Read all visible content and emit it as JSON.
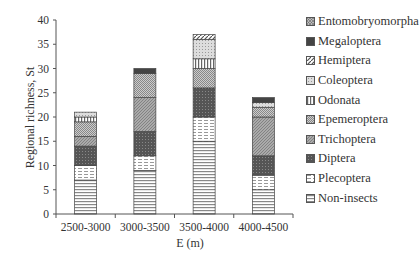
{
  "chart_data": {
    "type": "bar",
    "stacked": true,
    "title": "",
    "xlabel": "E (m)",
    "ylabel": "Regional richness, St",
    "ylim": [
      0,
      40
    ],
    "yticks": [
      0,
      5,
      10,
      15,
      20,
      25,
      30,
      35,
      40
    ],
    "grid": false,
    "legend_position": "right",
    "categories": [
      "2500-3000",
      "3000-3500",
      "3500-4000",
      "4000-4500"
    ],
    "series": [
      {
        "name": "Non-insects",
        "values": [
          7,
          9,
          15,
          5
        ],
        "pattern": "hstripes"
      },
      {
        "name": "Plecoptera",
        "values": [
          3,
          3,
          5,
          3
        ],
        "pattern": "dashes"
      },
      {
        "name": "Diptera",
        "values": [
          4,
          5,
          6,
          4
        ],
        "pattern": "dark-dots"
      },
      {
        "name": "Trichoptera",
        "values": [
          2,
          7,
          0,
          8
        ],
        "pattern": "diag-dense"
      },
      {
        "name": "Epemeroptera",
        "values": [
          3,
          5,
          4,
          2
        ],
        "pattern": "checker"
      },
      {
        "name": "Odonata",
        "values": [
          1,
          0,
          2,
          0
        ],
        "pattern": "vstripes"
      },
      {
        "name": "Coleoptera",
        "values": [
          1,
          0,
          4,
          1
        ],
        "pattern": "light-dots"
      },
      {
        "name": "Hemiptera",
        "values": [
          0,
          0,
          1,
          0
        ],
        "pattern": "diag-sparse"
      },
      {
        "name": "Megaloptera",
        "values": [
          0,
          1,
          0,
          1
        ],
        "pattern": "dark-solid"
      },
      {
        "name": "Entomobryomorpha",
        "values": [
          0,
          0,
          0,
          0
        ],
        "pattern": "crosshatch"
      }
    ],
    "totals": [
      21,
      30,
      37,
      24
    ]
  },
  "legend": {
    "items": [
      "Entomobryomorpha",
      "Megaloptera",
      "Hemiptera",
      "Coleoptera",
      "Odonata",
      "Epemeroptera",
      "Trichoptera",
      "Diptera",
      "Plecoptera",
      "Non-insects"
    ]
  },
  "axis": {
    "xlabel": "E (m)",
    "ylabel": "Regional richness, St"
  }
}
